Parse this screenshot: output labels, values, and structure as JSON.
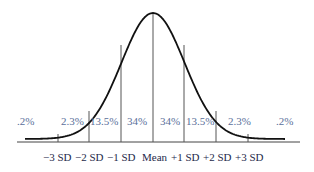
{
  "chart_data": {
    "type": "area",
    "title": "",
    "xlabel": "",
    "ylabel": "",
    "categories": [
      "-3 SD",
      "-2 SD",
      "-1 SD",
      "Mean",
      "+1 SD",
      "+2 SD",
      "+3 SD"
    ],
    "regions": [
      {
        "range": "< -3 SD",
        "label": ".2%",
        "value": 0.2
      },
      {
        "range": "-3 SD to -2 SD",
        "label": "2.3%",
        "value": 2.3
      },
      {
        "range": "-2 SD to -1 SD",
        "label": "13.5%",
        "value": 13.5
      },
      {
        "range": "-1 SD to Mean",
        "label": "34%",
        "value": 34
      },
      {
        "range": "Mean to +1 SD",
        "label": "34%",
        "value": 34
      },
      {
        "range": "+1 SD to +2 SD",
        "label": "13.5%",
        "value": 13.5
      },
      {
        "range": "+2 SD to +3 SD",
        "label": "2.3%",
        "value": 2.3
      },
      {
        "range": "> +3 SD",
        "label": ".2%",
        "value": 0.2
      }
    ],
    "distribution": "normal",
    "grid": false,
    "legend": "none"
  },
  "labels": {
    "pct": [
      ".2%",
      "2.3%",
      "13.5%",
      "34%",
      "34%",
      "13.5%",
      "2.3%",
      ".2%"
    ],
    "sd": [
      "−3 SD",
      "−2 SD",
      "−1 SD",
      "Mean",
      "+1 SD",
      "+2 SD",
      "+3 SD"
    ]
  },
  "colors": {
    "curve": "#111111",
    "lines": "#444444",
    "pct_text": "#5a6f9a",
    "sd_text": "#1e2a4a"
  }
}
